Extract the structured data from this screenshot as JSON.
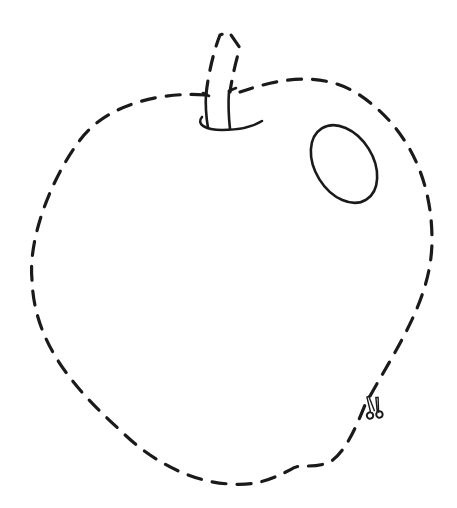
{
  "worksheet": {
    "subject": "apple",
    "description": "Cut-out apple outline with dashed cutting line",
    "line_color": "#1a1a1a",
    "background_color": "#ffffff"
  },
  "icons": {
    "scissors": "scissors-icon"
  }
}
